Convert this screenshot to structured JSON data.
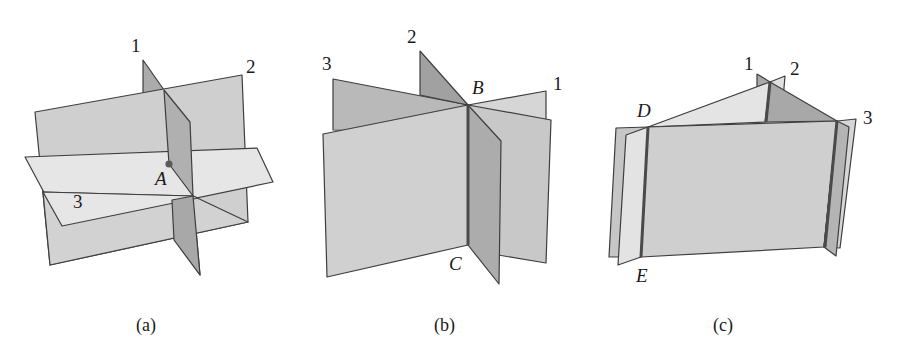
{
  "figure": {
    "colors": {
      "plane_light": "#e4e4e4",
      "plane_mid": "#cdcdcd",
      "plane_dark": "#a9a9a9",
      "edge": "#3e3e3e",
      "intersection_line": "#4a4a4a",
      "point": "#5a5a5a"
    },
    "panels": [
      {
        "id": "a",
        "caption": "(a)",
        "plane_labels": [
          "1",
          "2",
          "3"
        ],
        "point_labels": [
          "A"
        ],
        "description": "Three planes intersecting in a single point A"
      },
      {
        "id": "b",
        "caption": "(b)",
        "plane_labels": [
          "1",
          "2",
          "3"
        ],
        "point_labels": [
          "B",
          "C"
        ],
        "description": "Three planes intersecting along a common line BC"
      },
      {
        "id": "c",
        "caption": "(c)",
        "plane_labels": [
          "1",
          "2",
          "3"
        ],
        "point_labels": [
          "D",
          "E"
        ],
        "description": "Three planes intersecting pairwise in three parallel lines (prism); no common point"
      }
    ]
  }
}
